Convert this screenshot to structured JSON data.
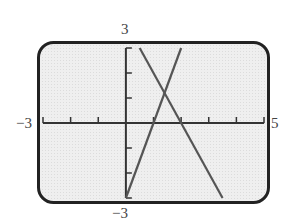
{
  "window": {
    "xmin": -3,
    "xmax": 5,
    "ymin": -3,
    "ymax": 3,
    "xscl": 1,
    "yscl": 1
  },
  "labels": {
    "ymax": "3",
    "ymin": "−3",
    "xmin": "−3",
    "xmax": "5"
  },
  "colors": {
    "frame": "#222222",
    "screen": "#ececec",
    "axis": "#333333",
    "lines": "#555555"
  },
  "chart_data": {
    "type": "line",
    "title": "",
    "xlabel": "",
    "ylabel": "",
    "xlim": [
      -3,
      5
    ],
    "ylim": [
      -3,
      3
    ],
    "grid": false,
    "legend": null,
    "tick_labels": {
      "x": [
        "-3",
        "5"
      ],
      "y": [
        "-3",
        "3"
      ]
    },
    "series": [
      {
        "name": "rising line (approx. y = 3x - 3)",
        "x": [
          0,
          2
        ],
        "y": [
          -3,
          3
        ]
      },
      {
        "name": "falling line (approx. y = -2x + 4)",
        "x": [
          0.5,
          3.5
        ],
        "y": [
          3,
          -3
        ]
      }
    ],
    "annotations": [
      {
        "text": "intersection",
        "x": 1.4,
        "y": 1.2
      }
    ]
  }
}
